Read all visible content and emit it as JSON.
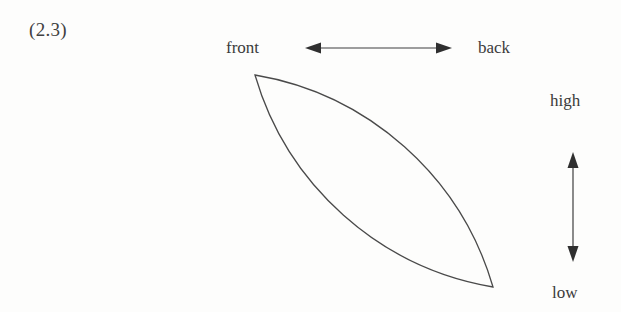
{
  "figure": {
    "number_label": "(2.3)",
    "caption_present": false
  },
  "axes": {
    "horizontal": {
      "left_label": "front",
      "right_label": "back",
      "arrow": "double-headed-horizontal-arrow",
      "x_start": 305,
      "x_end": 452,
      "y": 48
    },
    "vertical": {
      "top_label": "high",
      "bottom_label": "low",
      "arrow": "double-headed-vertical-arrow",
      "y_start": 152,
      "y_end": 262,
      "x": 573
    }
  },
  "shape": {
    "name": "lens-shape",
    "description": "vesica / leaf outline formed by two circular arcs meeting at two cusps",
    "tip_top_left": [
      255,
      75
    ],
    "tip_bottom_right": [
      493,
      287
    ],
    "upper_arc_midpoint": [
      400,
      135
    ],
    "lower_arc_midpoint": [
      350,
      228
    ],
    "stroke_color": "#4a4a4a",
    "stroke_width": 1.3,
    "fill": "none"
  },
  "colors": {
    "background": "#fdfdfc",
    "ink": "#3b3b3b",
    "stroke": "#4a4a4a"
  }
}
